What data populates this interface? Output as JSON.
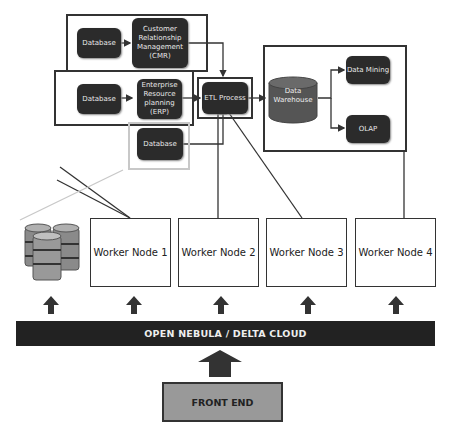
{
  "diagram": {
    "top_left": {
      "crm_group": {
        "database_label": "Database",
        "crm_label": "Customer Relationship Management (CMR)"
      },
      "erp_group": {
        "database_label": "Database",
        "erp_label": "Enterprise Resource planning (ERP)"
      },
      "standalone_database_label": "Database"
    },
    "etl": {
      "label": "ETL Process"
    },
    "warehouse_group": {
      "warehouse_label": "Data Warehouse",
      "data_mining_label": "Data Mining",
      "olap_label": "OLAP"
    },
    "worker_nodes": [
      {
        "label": "Worker Node 1"
      },
      {
        "label": "Worker Node 2"
      },
      {
        "label": "Worker Node 3"
      },
      {
        "label": "Worker Node 4"
      }
    ],
    "cloud_bar": {
      "label": "OPEN NEBULA / DELTA  CLOUD"
    },
    "front_end": {
      "label": "FRONT END"
    },
    "storage_icon": "database-stack-icon"
  },
  "colors": {
    "box_dark": "#2b2b2b",
    "cylinder": "#555555",
    "bar": "#222222",
    "front_end": "#999999",
    "frame": "#333333",
    "frame_light": "#c8c8c8"
  }
}
